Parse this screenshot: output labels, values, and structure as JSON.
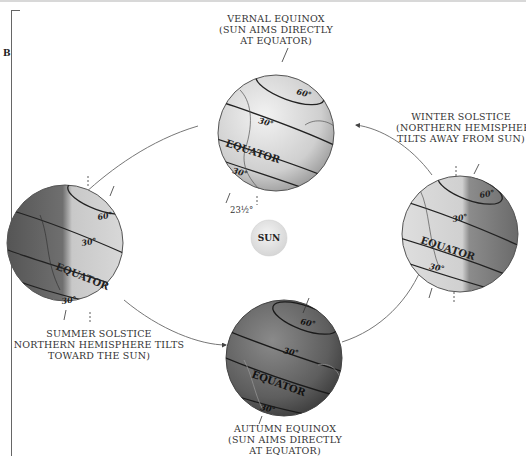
{
  "panel_letter": "B",
  "center": {
    "label": "SUN"
  },
  "positions": {
    "vernal": {
      "lines": [
        "VERNAL EQUINOX",
        "(SUN AIMS DIRECTLY",
        "AT EQUATOR)"
      ]
    },
    "winter": {
      "lines": [
        "WINTER SOLSTICE",
        "(NORTHERN HEMISPHERE",
        "TILTS AWAY FROM SUN)"
      ]
    },
    "summer": {
      "lines": [
        "SUMMER SOLSTICE",
        "NORTHERN HEMISPHERE TILTS",
        "TOWARD THE SUN)"
      ]
    },
    "autumn": {
      "lines": [
        "AUTUMN EQUINOX",
        "(SUN AIMS DIRECTLY",
        "AT EQUATOR)"
      ]
    }
  },
  "globe_labels": {
    "lat60": "60°",
    "lat30": "30°",
    "equator": "EQUATOR",
    "lat30s": "30°",
    "tilt": "23½°"
  },
  "colors": {
    "light_globe": "#d9d9d9",
    "dark_globe": "#6e6e6e",
    "sun": "#e6e6e6",
    "orbit": "#777777"
  }
}
